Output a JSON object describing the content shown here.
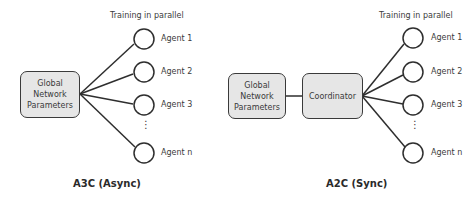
{
  "left_diagram": {
    "title": "A3C (Async)",
    "header": "Training in parallel",
    "global_box": "Global Network Parameters",
    "agents": [
      "Agent 1",
      "Agent 2",
      "Agent 3",
      "Agent n"
    ],
    "ellipsis": "⋮"
  },
  "right_diagram": {
    "title": "A2C (Sync)",
    "header": "Training in parallel",
    "global_box": "Global Network Parameters",
    "coordinator_box": "Coordinator",
    "agents": [
      "Agent 1",
      "Agent 2",
      "Agent 3",
      "Agent n"
    ],
    "ellipsis": "⋮"
  },
  "colors": {
    "box_fill": "#e6e6e6",
    "stroke": "#3a3a3a"
  }
}
